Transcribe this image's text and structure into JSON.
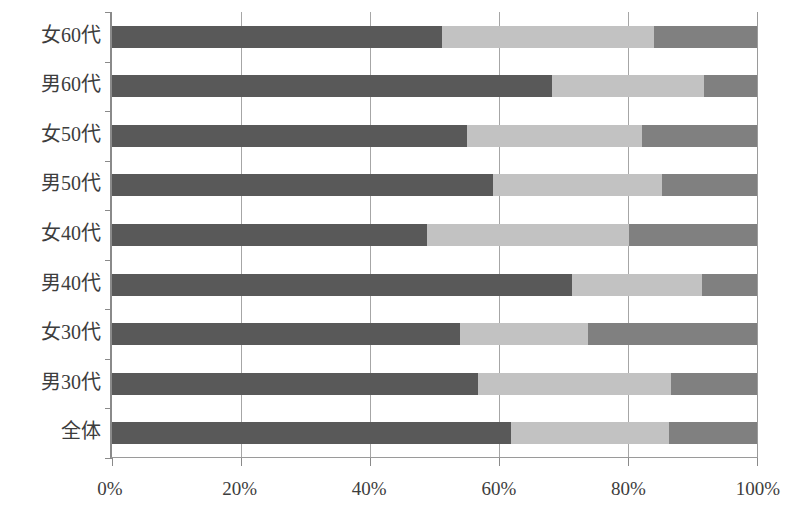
{
  "chart_data": {
    "type": "bar",
    "orientation": "horizontal",
    "stacked": true,
    "normalized": true,
    "title": "",
    "xlabel": "",
    "ylabel": "",
    "xlim": [
      0,
      100
    ],
    "xticks": [
      0,
      20,
      40,
      60,
      80,
      100
    ],
    "xticklabels": [
      "0%",
      "20%",
      "40%",
      "60%",
      "80%",
      "100%"
    ],
    "grid": "vertical",
    "legend": "none",
    "categories": [
      "女60代",
      "男60代",
      "女50代",
      "男50代",
      "女40代",
      "男40代",
      "女30代",
      "男30代",
      "全体"
    ],
    "series": [
      {
        "name": "series-1",
        "color": "#595959",
        "values": [
          51.2,
          68.2,
          55.1,
          59.1,
          48.8,
          71.3,
          54.0,
          56.8,
          61.9
        ]
      },
      {
        "name": "series-2",
        "color": "#c2c2c2",
        "values": [
          32.9,
          23.6,
          27.0,
          26.2,
          31.4,
          20.1,
          19.8,
          29.9,
          24.5
        ]
      },
      {
        "name": "series-3",
        "color": "#808080",
        "values": [
          15.9,
          8.2,
          17.9,
          14.7,
          19.8,
          8.6,
          26.2,
          13.3,
          13.6
        ]
      }
    ]
  }
}
